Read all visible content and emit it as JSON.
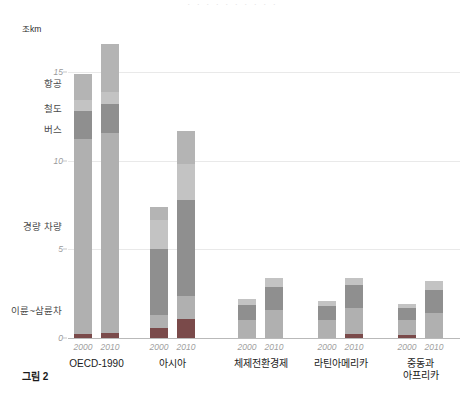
{
  "figure": {
    "caption": "그림 2",
    "unit_label": "조km",
    "top_clip_text": "· · · · · · · · · ·"
  },
  "axis": {
    "y_ticks": [
      {
        "value": 0,
        "label": "0"
      },
      {
        "value": 5,
        "label": "5"
      },
      {
        "value": 10,
        "label": "10"
      },
      {
        "value": 15,
        "label": "15"
      }
    ],
    "y_min": 0,
    "y_max": 17.5,
    "gridlines": true
  },
  "mode_labels": [
    {
      "key": "aviation",
      "label": "항공",
      "at_value": 14.4
    },
    {
      "key": "rail",
      "label": "철도",
      "at_value": 13.0
    },
    {
      "key": "bus",
      "label": "버스",
      "at_value": 11.8
    },
    {
      "key": "light_vehicle",
      "label": "경량 차량",
      "at_value": 6.3
    },
    {
      "key": "two_three_wheeler",
      "label": "이륜~삼륜차",
      "at_value": 1.6
    }
  ],
  "colors": {
    "aviation": "#b4b4b4",
    "rail": "#c3c3c3",
    "bus": "#8f8f8f",
    "light_vehicle": "#b0b0b0",
    "two_three_wheeler": "#7a4a4a",
    "gridline": "#e9e9e9",
    "axis": "#b9b9b9",
    "tick_text": "#9a9a9a",
    "label_text": "#4a4a4a"
  },
  "chart_data": {
    "type": "bar",
    "stacked": true,
    "title": "그림 2",
    "xlabel": "",
    "ylabel": "조km",
    "ylim": [
      0,
      17.5
    ],
    "grid": true,
    "legend_position": "left-inline",
    "categories": [
      "OECD-1990 2000",
      "OECD-1990 2010",
      "아시아 2000",
      "아시아 2010",
      "체제전환경제 2000",
      "체제전환경제 2010",
      "라틴아메리카 2000",
      "라틴아메리카 2010",
      "중동과 아프리카 2000",
      "중동과 아프리카 2010"
    ],
    "groups": [
      {
        "name": "OECD-1990",
        "bars": [
          {
            "year": "2000",
            "total": 14.9,
            "segments": [
              {
                "mode": "이륜~삼륜차",
                "value": 0.25
              },
              {
                "mode": "경량 차량",
                "value": 11.0
              },
              {
                "mode": "버스",
                "value": 1.55
              },
              {
                "mode": "철도",
                "value": 0.65
              },
              {
                "mode": "항공",
                "value": 1.45
              }
            ]
          },
          {
            "year": "2010",
            "total": 16.6,
            "segments": [
              {
                "mode": "이륜~삼륜차",
                "value": 0.3
              },
              {
                "mode": "경량 차량",
                "value": 11.3
              },
              {
                "mode": "버스",
                "value": 1.6
              },
              {
                "mode": "철도",
                "value": 0.7
              },
              {
                "mode": "항공",
                "value": 2.7
              }
            ]
          }
        ]
      },
      {
        "name": "아시아",
        "bars": [
          {
            "year": "2000",
            "total": 7.4,
            "segments": [
              {
                "mode": "이륜~삼륜차",
                "value": 0.55
              },
              {
                "mode": "경량 차량",
                "value": 0.75
              },
              {
                "mode": "버스",
                "value": 3.7
              },
              {
                "mode": "철도",
                "value": 1.65
              },
              {
                "mode": "항공",
                "value": 0.75
              }
            ]
          },
          {
            "year": "2010",
            "total": 11.7,
            "segments": [
              {
                "mode": "이륜~삼륜차",
                "value": 1.1
              },
              {
                "mode": "경량 차량",
                "value": 1.3
              },
              {
                "mode": "버스",
                "value": 5.4
              },
              {
                "mode": "철도",
                "value": 2.0
              },
              {
                "mode": "항공",
                "value": 1.9
              }
            ]
          }
        ]
      },
      {
        "name": "체제전환경제",
        "bars": [
          {
            "year": "2000",
            "total": 2.2,
            "segments": [
              {
                "mode": "이륜~삼륜차",
                "value": 0.0
              },
              {
                "mode": "경량 차량",
                "value": 1.0
              },
              {
                "mode": "버스",
                "value": 0.85
              },
              {
                "mode": "철도",
                "value": 0.35
              }
            ]
          },
          {
            "year": "2010",
            "total": 3.4,
            "segments": [
              {
                "mode": "이륜~삼륜차",
                "value": 0.0
              },
              {
                "mode": "경량 차량",
                "value": 1.6
              },
              {
                "mode": "버스",
                "value": 1.3
              },
              {
                "mode": "철도",
                "value": 0.5
              }
            ]
          }
        ]
      },
      {
        "name": "라틴아메리카",
        "bars": [
          {
            "year": "2000",
            "total": 2.1,
            "segments": [
              {
                "mode": "이륜~삼륜차",
                "value": 0.0
              },
              {
                "mode": "경량 차량",
                "value": 1.0
              },
              {
                "mode": "버스",
                "value": 0.8
              },
              {
                "mode": "철도",
                "value": 0.3
              }
            ]
          },
          {
            "year": "2010",
            "total": 3.4,
            "segments": [
              {
                "mode": "이륜~삼륜차",
                "value": 0.2
              },
              {
                "mode": "경량 차량",
                "value": 1.5
              },
              {
                "mode": "버스",
                "value": 1.3
              },
              {
                "mode": "철도",
                "value": 0.4
              }
            ]
          }
        ]
      },
      {
        "name": "중동과\n아프리카",
        "bars": [
          {
            "year": "2000",
            "total": 1.9,
            "segments": [
              {
                "mode": "이륜~삼륜차",
                "value": 0.15
              },
              {
                "mode": "경량 차량",
                "value": 0.85
              },
              {
                "mode": "버스",
                "value": 0.7
              },
              {
                "mode": "철도",
                "value": 0.2
              }
            ]
          },
          {
            "year": "2010",
            "total": 3.2,
            "segments": [
              {
                "mode": "이륜~삼륜차",
                "value": 0.0
              },
              {
                "mode": "경량 차량",
                "value": 1.4
              },
              {
                "mode": "버스",
                "value": 1.3
              },
              {
                "mode": "철도",
                "value": 0.5
              }
            ]
          }
        ]
      }
    ]
  }
}
